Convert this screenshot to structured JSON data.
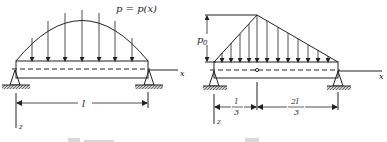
{
  "figures": [
    {
      "id": "left",
      "load_label": "p = p(x)",
      "axis_x": "x",
      "axis_z": "z",
      "span_label": "l",
      "load_shape": "parabolic"
    },
    {
      "id": "right",
      "peak_label": "p",
      "peak_subscript": "0",
      "axis_x": "x",
      "axis_z": "z",
      "left_dim_num": "l",
      "left_dim_den": "3",
      "right_dim_num": "2l",
      "right_dim_den": "3",
      "load_shape": "triangular"
    }
  ],
  "colors": {
    "ink": "#222222",
    "caption": "#d8d8d8"
  }
}
